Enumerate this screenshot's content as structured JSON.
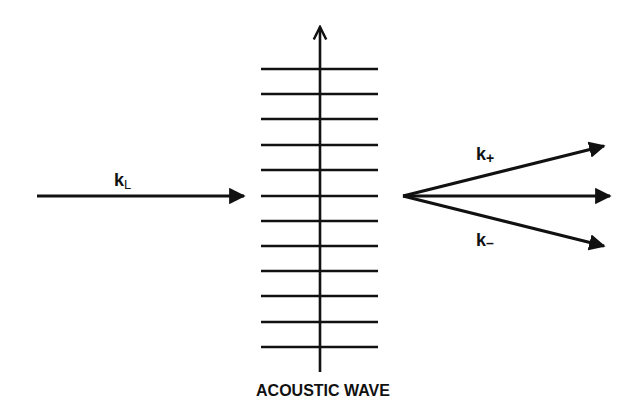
{
  "diagram": {
    "title": "ACOUSTIC WAVE",
    "incident_label": {
      "main": "k",
      "sub": "L"
    },
    "diffracted_labels": [
      {
        "main": "k",
        "sub": "+"
      },
      {
        "main": "k",
        "sub": "–"
      }
    ],
    "wavefront_count": 12,
    "colors": {
      "stroke": "#111111",
      "background": "#ffffff"
    }
  }
}
